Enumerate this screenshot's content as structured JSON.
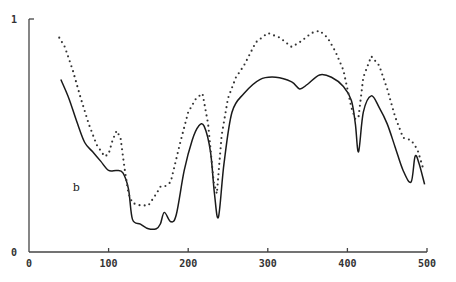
{
  "chart_data": {
    "type": "line",
    "title": "",
    "xlabel": "",
    "ylabel": "",
    "xlim": [
      0,
      500
    ],
    "ylim": [
      0,
      1
    ],
    "grid": false,
    "legend": null,
    "x_ticks": [
      "0",
      "100",
      "200",
      "300",
      "400",
      "500"
    ],
    "y_ticks": [
      "0",
      "1"
    ],
    "annotations": [
      {
        "text": "b",
        "x": 55,
        "y": 0.26
      }
    ],
    "series": [
      {
        "name": "solid",
        "style": "solid",
        "x": [
          40,
          50,
          60,
          70,
          80,
          90,
          100,
          110,
          118,
          125,
          130,
          140,
          150,
          160,
          165,
          170,
          178,
          185,
          195,
          205,
          213,
          220,
          228,
          233,
          238,
          245,
          255,
          270,
          290,
          310,
          330,
          340,
          350,
          365,
          380,
          395,
          405,
          410,
          414,
          420,
          430,
          440,
          450,
          460,
          470,
          480,
          485,
          490,
          497
        ],
        "y": [
          0.74,
          0.66,
          0.56,
          0.47,
          0.43,
          0.39,
          0.35,
          0.35,
          0.34,
          0.27,
          0.14,
          0.12,
          0.1,
          0.1,
          0.12,
          0.17,
          0.13,
          0.16,
          0.35,
          0.48,
          0.54,
          0.54,
          0.43,
          0.25,
          0.15,
          0.38,
          0.6,
          0.68,
          0.74,
          0.75,
          0.73,
          0.7,
          0.72,
          0.76,
          0.75,
          0.71,
          0.65,
          0.55,
          0.43,
          0.6,
          0.67,
          0.62,
          0.55,
          0.45,
          0.35,
          0.3,
          0.41,
          0.38,
          0.29
        ]
      },
      {
        "name": "dotted",
        "style": "dotted",
        "x": [
          38,
          45,
          55,
          65,
          75,
          85,
          95,
          100,
          105,
          110,
          115,
          120,
          125,
          130,
          140,
          150,
          160,
          165,
          170,
          178,
          190,
          200,
          210,
          218,
          225,
          232,
          236,
          242,
          250,
          260,
          270,
          285,
          300,
          315,
          330,
          340,
          355,
          365,
          375,
          385,
          395,
          405,
          410,
          414,
          420,
          430,
          440,
          450,
          460,
          470,
          480,
          488,
          495
        ],
        "y": [
          0.92,
          0.88,
          0.78,
          0.66,
          0.55,
          0.46,
          0.41,
          0.42,
          0.48,
          0.52,
          0.49,
          0.36,
          0.25,
          0.21,
          0.2,
          0.2,
          0.25,
          0.28,
          0.28,
          0.3,
          0.47,
          0.6,
          0.66,
          0.68,
          0.55,
          0.3,
          0.25,
          0.5,
          0.66,
          0.75,
          0.8,
          0.9,
          0.94,
          0.92,
          0.88,
          0.9,
          0.94,
          0.95,
          0.92,
          0.86,
          0.78,
          0.62,
          0.57,
          0.58,
          0.75,
          0.84,
          0.8,
          0.7,
          0.58,
          0.49,
          0.48,
          0.44,
          0.36
        ]
      }
    ],
    "colors": {
      "solid": "#1a1a1a",
      "dotted": "#333333",
      "axis": "#444444"
    }
  }
}
